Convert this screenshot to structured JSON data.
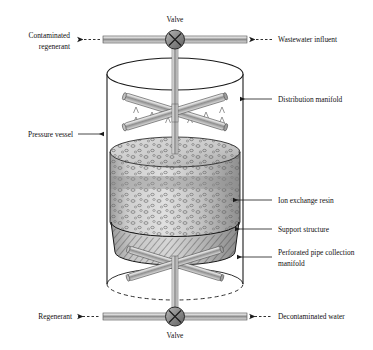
{
  "figure": {
    "background_color": "#ffffff",
    "line_color": "#1a1a1a",
    "pipe_color": "#9a9a9a",
    "resin_color": "#c9c9c9",
    "support_color": "#b5b5b5"
  },
  "labels": {
    "valve_top": "Valve",
    "valve_bottom": "Valve",
    "contaminated_regenerant_line1": "Contaminated",
    "contaminated_regenerant_line2": "regenerant",
    "wastewater_influent": "Wastewater influent",
    "pressure_vessel": "Pressure vessel",
    "distribution_manifold": "Distribution manifold",
    "ion_exchange_resin": "Ion exchange resin",
    "support_structure": "Support structure",
    "perforated_manifold_line1": "Perforated pipe collection",
    "perforated_manifold_line2": "manifold",
    "regenerant": "Regenerant",
    "decontaminated_water": "Decontaminated water"
  },
  "flows": [
    {
      "name": "contaminated-regenerant",
      "direction": "left",
      "label": "Contaminated regenerant"
    },
    {
      "name": "wastewater-influent",
      "direction": "left",
      "label": "Wastewater influent"
    },
    {
      "name": "regenerant",
      "direction": "right",
      "label": "Regenerant"
    },
    {
      "name": "decontaminated-water",
      "direction": "right",
      "label": "Decontaminated water"
    }
  ],
  "components": [
    {
      "name": "top-valve",
      "type": "valve"
    },
    {
      "name": "bottom-valve",
      "type": "valve"
    },
    {
      "name": "pressure-vessel",
      "type": "cylinder"
    },
    {
      "name": "distribution-manifold",
      "type": "cross-pipe"
    },
    {
      "name": "ion-exchange-resin",
      "type": "packed-bed"
    },
    {
      "name": "support-structure",
      "type": "hatched-cylinder"
    },
    {
      "name": "collection-manifold",
      "type": "cross-pipe"
    }
  ]
}
